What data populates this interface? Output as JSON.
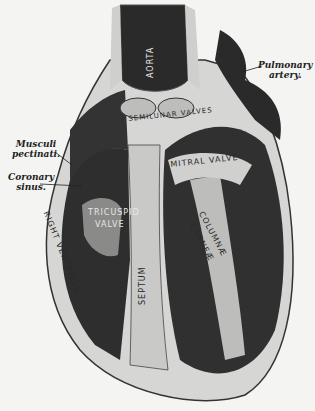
{
  "figure": {
    "colors": {
      "background": "#f4f4f2",
      "tissue_dark": "#2b2b2b",
      "tissue_light": "#cfcfcf",
      "line": "#222222"
    }
  },
  "callouts": {
    "pulmonary_artery": {
      "line1": "Pulmonary",
      "line2": "artery."
    },
    "musculi_pectinati": {
      "line1": "Musculi",
      "line2": "pectinati."
    },
    "coronary_sinus": {
      "line1": "Coronary",
      "line2": "sinus."
    }
  },
  "inline_labels": {
    "aorta": "AORTA",
    "semilunar_valves": "SEMILUNAR VALVES",
    "mitral_valve": "MITRAL VALVE",
    "tricuspid_valve_1": "TRICUSPID",
    "tricuspid_valve_2": "VALVE",
    "septum": "SEPTUM",
    "right_ventricle": "RIGHT VENTRICLE",
    "columnae_carneae_1": "COLUMNÆ",
    "columnae_carneae_2": "CARNEÆ"
  }
}
